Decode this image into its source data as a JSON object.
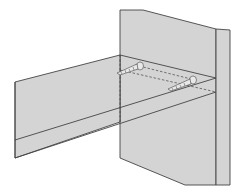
{
  "diagram": {
    "colors": {
      "panel_fill": "#d4d4d4",
      "stroke": "#444444",
      "background": "#ffffff"
    },
    "parts": [
      {
        "id": "side-panel",
        "label": "Vertical side panel"
      },
      {
        "id": "side-panel-edge",
        "label": "Side panel edge strip"
      },
      {
        "id": "shelf",
        "label": "Horizontal shelf"
      },
      {
        "id": "shelf-front-edge",
        "label": "Shelf front edge"
      },
      {
        "id": "screw-1",
        "label": "Screw (rear)"
      },
      {
        "id": "screw-2",
        "label": "Screw (front)"
      }
    ]
  }
}
